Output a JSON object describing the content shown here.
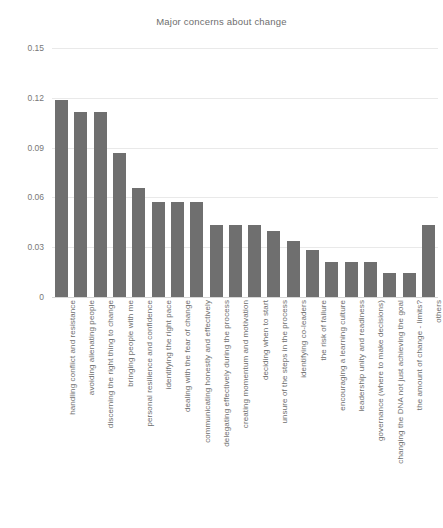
{
  "chart_data": {
    "type": "bar",
    "title": "Major concerns about change",
    "xlabel": "",
    "ylabel": "",
    "ylim": [
      0,
      0.15
    ],
    "yticks": [
      0,
      0.03,
      0.06,
      0.09,
      0.12,
      0.15
    ],
    "ytick_labels": [
      "0",
      "0.03",
      "0.06",
      "0.09",
      "0.12",
      "0.15"
    ],
    "grid": true,
    "legend": false,
    "bar_color": "#6f6f6f",
    "categories": [
      "handling conflict and resistance",
      "avoiding alienating people",
      "discerning the right thing to change",
      "bringing people with me",
      "personal resilience and confidence",
      "identifying the right pace",
      "dealing with the fear of change",
      "communicating honestly and effectively",
      "delegating effectively during the process",
      "creating momentum and motivation",
      "deciding when to start",
      "unsure of the steps in the process",
      "identifying co-leaders",
      "the risk of failure",
      "encouraging a learning culture",
      "leadership unity and readiness",
      "governance (where to make decisions)",
      "changing the DNA not just achieving the goal",
      "the amount of change - limits?",
      "others"
    ],
    "values": [
      0.1185,
      0.1115,
      0.1115,
      0.0865,
      0.0655,
      0.057,
      0.057,
      0.057,
      0.0435,
      0.0435,
      0.0435,
      0.04,
      0.034,
      0.0285,
      0.0213,
      0.0213,
      0.0213,
      0.0147,
      0.0147,
      0.0435
    ]
  }
}
